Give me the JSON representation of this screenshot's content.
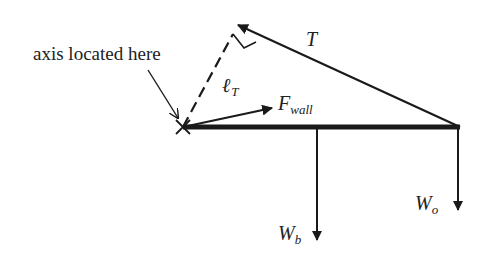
{
  "diagram": {
    "type": "free-body-diagram",
    "colors": {
      "ink": "#1a1a1a",
      "background": "#ffffff"
    },
    "labels": {
      "axis_note": "axis located here",
      "tension": "T",
      "lever_arm_main": "ℓ",
      "lever_arm_sub": "T",
      "wall_force_main": "F",
      "wall_force_sub": "wall",
      "beam_weight_main": "W",
      "beam_weight_sub": "b",
      "object_weight_main": "W",
      "object_weight_sub": "o"
    },
    "elements": [
      {
        "name": "beam",
        "from": [
          183,
          127
        ],
        "to": [
          460,
          127
        ]
      },
      {
        "name": "tension-force",
        "from": [
          460,
          127
        ],
        "to": [
          236,
          24
        ]
      },
      {
        "name": "lever-arm-dashed",
        "from": [
          183,
          127
        ],
        "to": [
          233,
          34
        ]
      },
      {
        "name": "wall-force",
        "from": [
          183,
          127
        ],
        "to": [
          270,
          108
        ]
      },
      {
        "name": "beam-weight",
        "from": [
          317,
          127
        ],
        "to": [
          317,
          240
        ]
      },
      {
        "name": "object-weight",
        "from": [
          458,
          127
        ],
        "to": [
          458,
          210
        ]
      },
      {
        "name": "axis-pointer",
        "from": [
          148,
          70
        ],
        "to": [
          178,
          118
        ]
      }
    ]
  }
}
